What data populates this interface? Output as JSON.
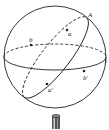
{
  "diagram": {
    "title": "",
    "colors": {
      "stroke": "#222222",
      "background": "#ffffff"
    },
    "labels": {
      "A": "A",
      "a": "a",
      "b": "b",
      "t": "t",
      "b_prime": "b'",
      "a_prime": "a'"
    },
    "elements": [
      "sphere-outline",
      "equator-great-circle",
      "tilted-great-circle",
      "points a b b' a'",
      "cylinder-stand"
    ]
  }
}
